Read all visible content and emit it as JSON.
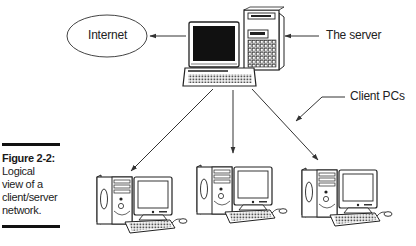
{
  "figure": {
    "number": "Figure 2-2:",
    "caption_lines": [
      "Logical",
      "view of a",
      "client/server",
      "network."
    ]
  },
  "nodes": {
    "internet": {
      "label": "Internet",
      "shape": "ellipse"
    },
    "server": {
      "label": "The server",
      "icon": "server-computer-icon"
    },
    "clients": {
      "label": "Client PCs",
      "items": [
        {
          "icon": "client-pc-icon"
        },
        {
          "icon": "client-pc-icon"
        },
        {
          "icon": "client-pc-icon"
        }
      ]
    }
  },
  "edges": [
    {
      "from": "server",
      "to": "internet",
      "style": "arrow"
    },
    {
      "from": "server",
      "to": "client-1",
      "style": "arrow"
    },
    {
      "from": "server",
      "to": "client-2",
      "style": "arrow"
    },
    {
      "from": "server",
      "to": "client-3",
      "style": "arrow"
    }
  ],
  "colors": {
    "line": "#333333",
    "screen": "#111111",
    "background": "#ffffff"
  }
}
